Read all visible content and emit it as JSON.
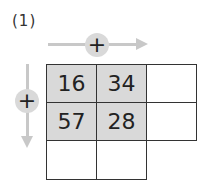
{
  "problem_label": "(1)",
  "operator_horizontal": "+",
  "operator_vertical": "+",
  "grid": {
    "rows": [
      [
        "16",
        "34",
        ""
      ],
      [
        "57",
        "28",
        ""
      ],
      [
        "",
        "",
        ""
      ]
    ]
  },
  "colors": {
    "shade": "#d9d9d9",
    "arrow": "#c8c8c8",
    "border": "#333333"
  }
}
